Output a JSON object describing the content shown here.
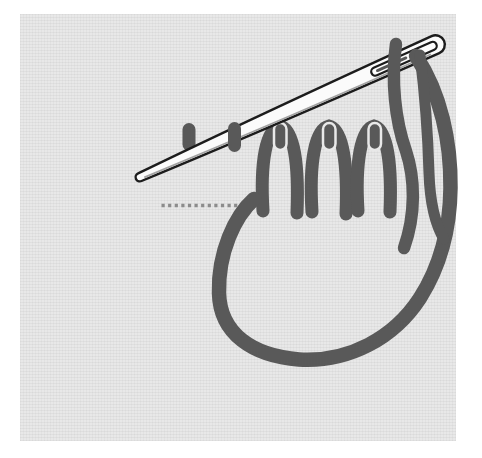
{
  "figure": {
    "type": "illustration",
    "colors": {
      "page_background": "#ffffff",
      "fabric": "#e8e8e8",
      "thread": "#595959",
      "guide_dots": "#8c8c8c",
      "needle_fill": "#fbfbfb",
      "needle_outline": "#1c1c1c"
    },
    "elements": {
      "needle": "sewing needle with threaded eye",
      "thread_loop": "large working-thread loop",
      "thread_tail": "short thread tail from needle eye",
      "loop_stitches": 3,
      "tie_down_stitches": 3,
      "straight_stitches": 2,
      "guide_dot_count": 13
    }
  }
}
